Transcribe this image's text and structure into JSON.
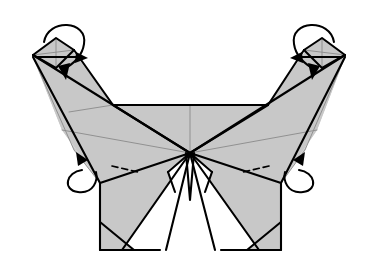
{
  "figure": {
    "view": "front",
    "background_color": "#ffffff",
    "paper_front_color": "#c8c8c8",
    "paper_back_color": "#ffffff",
    "line_color": "#000000",
    "soft_line_color": "#8a8a8a",
    "canvas": {
      "width": 369,
      "height": 273
    }
  },
  "shapes": {
    "left_wing_upper": {
      "name": "left-upper-wing",
      "fill": "#c8c8c8",
      "points": "33,55 60,41 72,50 113,105 113,105 69,115 33,57"
    },
    "left_wing_main": {
      "name": "left-main-wing",
      "fill": "#c8c8c8",
      "points": "33,57 190,153 100,183 62,130"
    },
    "left_wing_lower_sliver": {
      "name": "left-wing-edge-sliver",
      "fill": "#c8c8c8",
      "points": "33,57 62,130 100,183 74,150"
    },
    "right_wing_upper": {
      "name": "right-upper-wing",
      "fill": "#c8c8c8",
      "points": "345,55 318,41 306,50 268,105 268,105 310,115 345,57"
    },
    "right_wing_main": {
      "name": "right-main-wing",
      "fill": "#c8c8c8",
      "points": "345,57 190,153 281,183 317,130"
    },
    "right_wing_lower_sliver": {
      "name": "right-wing-edge-sliver",
      "fill": "#c8c8c8",
      "points": "345,57 317,130 281,183 305,150"
    },
    "center_panel_left": {
      "name": "center-panel-left",
      "fill": "#c8c8c8",
      "points": "113,105 190,105 190,153"
    },
    "center_panel_right": {
      "name": "center-panel-right",
      "fill": "#c8c8c8",
      "points": "190,105 268,105 190,153"
    },
    "body_left": {
      "name": "body-left-panel",
      "fill": "#c8c8c8",
      "points": "100,183 190,153 160,250 100,250"
    },
    "body_right": {
      "name": "body-right-panel",
      "fill": "#c8c8c8",
      "points": "281,183 190,153 221,250 281,250"
    },
    "body_wedge_left": {
      "name": "body-white-wedge-left",
      "fill": "#ffffff",
      "points": "190,153 166,250 122,250"
    },
    "body_wedge_right": {
      "name": "body-white-wedge-right",
      "fill": "#ffffff",
      "points": "190,153 215,250 259,250"
    },
    "body_corner_left": {
      "name": "body-corner-triangle-left",
      "fill": "#c8c8c8",
      "points": "100,222 100,250 134,250"
    },
    "body_corner_right": {
      "name": "body-corner-triangle-right",
      "fill": "#c8c8c8",
      "points": "281,222 281,250 247,250"
    },
    "center_spike": {
      "name": "center-vertical-spike",
      "fill": "#ffffff",
      "points": "186,153 190,200 194,153"
    },
    "notch_left": {
      "name": "center-notch-left",
      "fill": "#ffffff",
      "points": "190,153 175,190 168,170"
    },
    "notch_right": {
      "name": "center-notch-right",
      "fill": "#ffffff",
      "points": "190,153 205,190 212,170"
    },
    "tip_left_kite": {
      "name": "left-tip-kite",
      "fill": "#c8c8c8",
      "points": "33,55 56,38 74,50 56,68"
    },
    "tip_right_kite": {
      "name": "right-tip-kite",
      "fill": "#c8c8c8",
      "points": "345,55 322,38 304,50 322,68"
    }
  },
  "fold_lines": {
    "hard": [
      "M33,55 L190,153",
      "M33,57 L100,183",
      "M100,183 L190,153",
      "M345,55 L190,153",
      "M345,57 L281,183",
      "M281,183 L190,153",
      "M113,105 L268,105",
      "M113,105 L190,153",
      "M268,105 L190,153",
      "M100,183 L100,250",
      "M281,183 L281,250",
      "M100,250 L160,250",
      "M221,250 L281,250",
      "M190,153 L122,250",
      "M190,153 L166,250",
      "M190,153 L259,250",
      "M190,153 L215,250",
      "M100,222 L134,250",
      "M281,222 L247,250",
      "M186,153 L190,200 L194,153",
      "M190,153 L168,172",
      "M190,153 L212,172",
      "M168,172 L175,192",
      "M212,172 L205,192",
      "M33,55 L56,38 L74,50",
      "M345,55 L322,38 L304,50",
      "M33,55 L56,68 L74,50",
      "M345,55 L322,68 L304,50",
      "M74,50 L113,105",
      "M304,50 L268,105"
    ],
    "soft": [
      "M190,105 L190,153",
      "M62,130 L190,153",
      "M317,130 L190,153",
      "M33,57 L74,150 L100,183",
      "M345,57 L305,150 L281,183",
      "M56,38 L56,68",
      "M322,38 L322,68",
      "M33,55 L74,50",
      "M345,55 L304,50",
      "M69,112 L113,105"
    ],
    "dashed": [
      "M36,57 L78,57",
      "M342,57 L300,57",
      "M112,166 L138,172",
      "M269,166 L243,172"
    ]
  },
  "arrows": [
    {
      "name": "left-tip-fold-arrow",
      "kind": "fold-over-loop",
      "loop_path": "M44,42 C48,18 88,20 84,44 C82,58 70,66 62,70",
      "shaft_path": "M38,57 L76,57",
      "head_points": "76,52 88,58 75,63",
      "head2_points": "58,66 66,80 70,63"
    },
    {
      "name": "right-tip-fold-arrow",
      "kind": "fold-over-loop",
      "loop_path": "M334,42 C330,18 290,20 294,44 C296,58 308,66 316,70",
      "shaft_path": "M340,57 L302,57",
      "head_points": "302,52 290,58 303,63",
      "head2_points": "320,66 312,80 308,63"
    },
    {
      "name": "left-curl-under-arrow",
      "kind": "curl-behind",
      "loop_path": "M82,170 C66,172 62,190 78,192 C94,194 98,180 96,172",
      "head_points": "76,152 88,160 78,166"
    },
    {
      "name": "right-curl-under-arrow",
      "kind": "curl-behind",
      "loop_path": "M299,170 C315,172 319,190 303,192 C287,194 283,180 285,172",
      "head_points": "305,152 293,160 303,166"
    }
  ],
  "annotations": {
    "center_vertex": {
      "name": "center-convergence-point",
      "x": 190,
      "y": 153
    },
    "left_tip_vertex": {
      "name": "left-wing-tip",
      "x": 33,
      "y": 55
    },
    "right_tip_vertex": {
      "name": "right-wing-tip",
      "x": 345,
      "y": 55
    }
  }
}
